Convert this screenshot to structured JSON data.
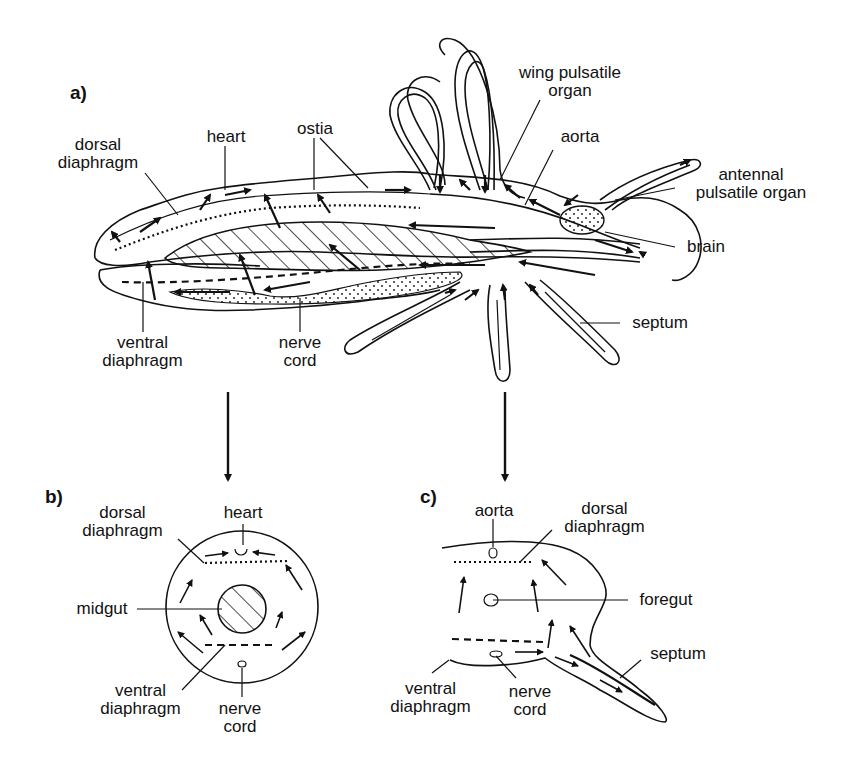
{
  "figure": {
    "panels": [
      {
        "id": "a",
        "label": "a)",
        "labels": {
          "dorsal_diaphragm": "dorsal\ndiaphragm",
          "heart": "heart",
          "ostia": "ostia",
          "wing_pulsatile_organ": "wing pulsatile\norgan",
          "aorta": "aorta",
          "antennal_pulsatile_organ": "antennal\npulsatile organ",
          "brain": "brain",
          "septum": "septum",
          "ventral_diaphragm": "ventral\ndiaphragm",
          "nerve_cord": "nerve\ncord"
        }
      },
      {
        "id": "b",
        "label": "b)",
        "labels": {
          "dorsal_diaphragm": "dorsal\ndiaphragm",
          "heart": "heart",
          "midgut": "midgut",
          "ventral_diaphragm": "ventral\ndiaphragm",
          "nerve_cord": "nerve\ncord"
        }
      },
      {
        "id": "c",
        "label": "c)",
        "labels": {
          "aorta": "aorta",
          "dorsal_diaphragm": "dorsal\ndiaphragm",
          "foregut": "foregut",
          "septum": "septum",
          "ventral_diaphragm": "ventral\ndiaphragm",
          "nerve_cord": "nerve\ncord"
        }
      }
    ],
    "colors": {
      "ink": "#111111",
      "background": "#ffffff"
    }
  }
}
